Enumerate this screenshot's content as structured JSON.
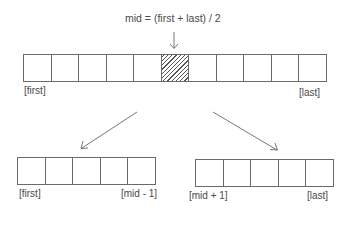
{
  "diagram": {
    "formula": "mid = (first + last) / 2",
    "top_array": {
      "cell_count": 11,
      "highlighted_index": 5,
      "left_label": "[first]",
      "right_label": "[last]"
    },
    "left_array": {
      "cell_count": 5,
      "left_label": "[first]",
      "right_label": "[mid - 1]"
    },
    "right_array": {
      "cell_count": 5,
      "left_label": "[mid + 1]",
      "right_label": "[last]"
    },
    "colors": {
      "stroke": "#6a6a6a",
      "text": "#4a4a4a",
      "hatch": "#555555"
    }
  }
}
